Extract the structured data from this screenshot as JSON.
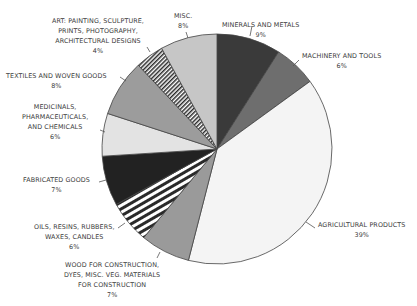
{
  "chart_data": {
    "type": "pie",
    "title": "",
    "start_angle_deg": 0,
    "direction": "clockwise",
    "slices": [
      {
        "label": "MINERALS AND METALS",
        "value": 9,
        "pct_label": "9%",
        "color": "#3a3a3a",
        "pattern": "solid"
      },
      {
        "label": "MACHINERY AND TOOLS",
        "value": 6,
        "pct_label": "6%",
        "color": "#6e6e6e",
        "pattern": "solid"
      },
      {
        "label": "AGRICULTURAL PRODUCTS",
        "value": 39,
        "pct_label": "39%",
        "color": "#f4f4f4",
        "pattern": "solid"
      },
      {
        "label": "WOOD FOR CONSTRUCTION,\nDYES, MISC. VEG. MATERIALS\nFOR CONSTRUCTION",
        "value": 7,
        "pct_label": "7%",
        "color": "#9a9a9a",
        "pattern": "solid"
      },
      {
        "label": "OILS, RESINS, RUBBERS,\nWAXES, CANDLES",
        "value": 6,
        "pct_label": "6%",
        "color": "#ffffff",
        "pattern": "horizontal-stripes"
      },
      {
        "label": "FABRICATED GOODS",
        "value": 7,
        "pct_label": "7%",
        "color": "#222222",
        "pattern": "solid"
      },
      {
        "label": "MEDICINALS,\nPHARMACEUTICALS,\nAND CHEMICALS",
        "value": 6,
        "pct_label": "6%",
        "color": "#e3e3e3",
        "pattern": "solid"
      },
      {
        "label": "TEXTILES AND WOVEN GOODS",
        "value": 8,
        "pct_label": "8%",
        "color": "#9c9c9c",
        "pattern": "solid"
      },
      {
        "label": "ART: PAINTING, SCULPTURE,\nPRINTS, PHOTOGRAPHY,\nARCHITECTURAL DESIGNS",
        "value": 4,
        "pct_label": "4%",
        "color": "#ffffff",
        "pattern": "diagonal-stripes"
      },
      {
        "label": "MISC.",
        "value": 8,
        "pct_label": "8%",
        "color": "#c6c6c6",
        "pattern": "solid"
      }
    ],
    "legend": "none (leader-line labels)"
  },
  "labels": {
    "minerals": {
      "name": "MINERALS AND METALS",
      "pct": "9%"
    },
    "machinery": {
      "name": "MACHINERY AND TOOLS",
      "pct": "6%"
    },
    "agricultural": {
      "name": "AGRICULTURAL PRODUCTS",
      "pct": "39%"
    },
    "wood": {
      "name": "WOOD FOR CONSTRUCTION,\nDYES, MISC. VEG. MATERIALS\nFOR CONSTRUCTION",
      "pct": "7%"
    },
    "oils": {
      "name": "OILS, RESINS, RUBBERS,\nWAXES, CANDLES",
      "pct": "6%"
    },
    "fabricated": {
      "name": "FABRICATED GOODS",
      "pct": "7%"
    },
    "medicinals": {
      "name": "MEDICINALS,\nPHARMACEUTICALS,\nAND CHEMICALS",
      "pct": "6%"
    },
    "textiles": {
      "name": "TEXTILES AND WOVEN GOODS",
      "pct": "8%"
    },
    "art": {
      "name": "ART: PAINTING, SCULPTURE,\nPRINTS, PHOTOGRAPHY,\nARCHITECTURAL DESIGNS",
      "pct": "4%"
    },
    "misc": {
      "name": "MISC.",
      "pct": "8%"
    }
  }
}
